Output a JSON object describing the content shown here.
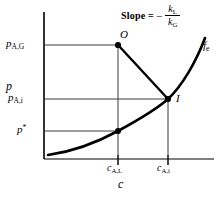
{
  "figure": {
    "axes": {
      "y_axis_label": "p",
      "x_axis_label": "c"
    },
    "y_ticks": [
      {
        "id": "p_AG",
        "base": "p",
        "sub": "A,G",
        "sup": "",
        "value_px": 45
      },
      {
        "id": "p_Ai",
        "base": "p",
        "sub": "A,i",
        "sup": "",
        "value_px": 99
      },
      {
        "id": "p_star",
        "base": "p",
        "sub": "",
        "sup": "*",
        "value_px": 131
      }
    ],
    "x_ticks": [
      {
        "id": "c_AL",
        "base": "c",
        "sub": "A,L",
        "value_px": 118
      },
      {
        "id": "c_Ai",
        "base": "c",
        "sub": "A,i",
        "value_px": 168
      }
    ],
    "points": [
      {
        "id": "O",
        "label": "O",
        "x_px": 118,
        "y_px": 45,
        "filled": true
      },
      {
        "id": "I",
        "label": "I",
        "x_px": 168,
        "y_px": 99,
        "filled": true
      },
      {
        "id": "S",
        "label": "",
        "x_px": 118,
        "y_px": 131,
        "filled": true
      }
    ],
    "curve": {
      "label_base": "f",
      "label_sub": "e",
      "name": "equilibrium-curve"
    },
    "annotation": {
      "slope_text": "Slope =",
      "minus_sign": "−",
      "numerator_base": "k",
      "numerator_sub": "L",
      "denominator_base": "k",
      "denominator_sub": "G"
    },
    "colors": {
      "ink": "#000000",
      "background": "#ffffff",
      "grid_line": "#4a4a4a"
    }
  }
}
